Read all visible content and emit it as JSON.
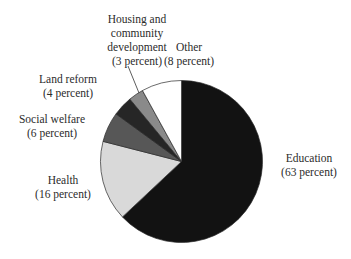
{
  "chart_data": {
    "type": "pie",
    "title": "",
    "start_angle_deg": 0,
    "direction": "clockwise",
    "slices": [
      {
        "label": "Education",
        "value": 63,
        "value_label": "(63 percent)",
        "color": "#121212"
      },
      {
        "label": "Health",
        "value": 16,
        "value_label": "(16 percent)",
        "color": "#d9d9d9"
      },
      {
        "label": "Social welfare",
        "value": 6,
        "value_label": "(6 percent)",
        "color": "#575757"
      },
      {
        "label": "Land reform",
        "value": 4,
        "value_label": "(4 percent)",
        "color": "#262626"
      },
      {
        "label": "Housing and community development",
        "value": 3,
        "value_label": "(3 percent)",
        "color": "#8a8a8a"
      },
      {
        "label": "Other",
        "value": 8,
        "value_label": "(8 percent)",
        "color": "#ffffff"
      }
    ],
    "categories": [
      "Education",
      "Health",
      "Social welfare",
      "Land reform",
      "Housing and community development",
      "Other"
    ],
    "values": [
      63,
      16,
      6,
      4,
      3,
      8
    ],
    "units": "percent",
    "legend": "none (direct labels)"
  },
  "labels": {
    "housing": {
      "line1": "Housing and",
      "line2": "community",
      "line3": "development",
      "pct": "(3 percent)"
    },
    "other": {
      "line1": "Other",
      "pct": "(8 percent)"
    },
    "land_reform": {
      "line1": "Land reform",
      "pct": "(4 percent)"
    },
    "social_welfare": {
      "line1": "Social welfare",
      "pct": "(6 percent)"
    },
    "health": {
      "line1": "Health",
      "pct": "(16 percent)"
    },
    "education": {
      "line1": "Education",
      "pct": "(63 percent)"
    }
  }
}
